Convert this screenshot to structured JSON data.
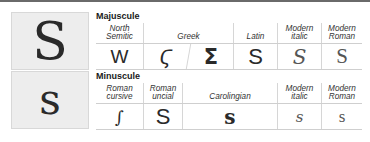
{
  "left_panels": {
    "majuscule_glyph": "S",
    "minuscule_glyph": "s"
  },
  "majuscule": {
    "title": "Majuscule",
    "columns": [
      {
        "label": "North Semitic",
        "line1": "North",
        "line2": "Semitic",
        "glyph": "W"
      },
      {
        "label": "Greek",
        "line1": "",
        "line2": "Greek",
        "glyph": "Ϛ",
        "glyph2": "Σ"
      },
      {
        "label": "Latin",
        "line1": "",
        "line2": "Latin",
        "glyph": "S"
      },
      {
        "label": "Modern italic",
        "line1": "Modern",
        "line2": "italic",
        "glyph": "S"
      },
      {
        "label": "Modern Roman",
        "line1": "Modern",
        "line2": "Roman",
        "glyph": "S"
      }
    ]
  },
  "minuscule": {
    "title": "Minuscule",
    "columns": [
      {
        "label": "Roman cursive",
        "line1": "Roman",
        "line2": "cursive",
        "glyph": "∫"
      },
      {
        "label": "Roman uncial",
        "line1": "Roman",
        "line2": "uncial",
        "glyph": "S"
      },
      {
        "label": "Carolingian",
        "line1": "",
        "line2": "Carolingian",
        "glyph": "s"
      },
      {
        "label": "Modern italic",
        "line1": "Modern",
        "line2": "italic",
        "glyph": "s"
      },
      {
        "label": "Modern Roman",
        "line1": "Modern",
        "line2": "Roman",
        "glyph": "s"
      }
    ]
  },
  "colors": {
    "panel_bg": "#ededed",
    "rule": "#6a6a6a",
    "text": "#2a2a2a"
  }
}
